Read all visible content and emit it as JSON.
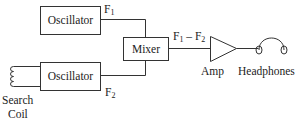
{
  "diagram": {
    "type": "block-diagram",
    "blocks": {
      "oscillator_top": {
        "label": "Oscillator"
      },
      "oscillator_bottom": {
        "label": "Oscillator"
      },
      "mixer": {
        "label": "Mixer"
      },
      "amp": {
        "label": "Amp",
        "shape": "triangle"
      },
      "headphones": {
        "label": "Headphones"
      },
      "search_coil": {
        "label_line1": "Search",
        "label_line2": "Coil"
      }
    },
    "signals": {
      "f1": {
        "base": "F",
        "sub": "1"
      },
      "f2": {
        "base": "F",
        "sub": "2"
      },
      "diff": {
        "a_base": "F",
        "a_sub": "1",
        "op": " – ",
        "b_base": "F",
        "b_sub": "2"
      }
    },
    "connections": [
      {
        "from": "Oscillator (top)",
        "to": "Mixer",
        "signal": "F1"
      },
      {
        "from": "Search Coil",
        "to": "Oscillator (bottom)"
      },
      {
        "from": "Oscillator (bottom)",
        "to": "Mixer",
        "signal": "F2"
      },
      {
        "from": "Mixer",
        "to": "Amp",
        "signal": "F1 – F2"
      },
      {
        "from": "Amp",
        "to": "Headphones"
      }
    ],
    "colors": {
      "stroke": "#333333",
      "background": "#ffffff"
    }
  }
}
